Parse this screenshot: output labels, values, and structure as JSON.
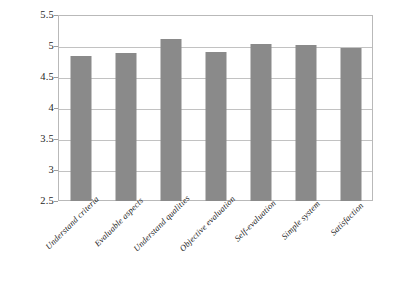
{
  "chart_data": {
    "type": "bar",
    "title": "",
    "subtitle": "",
    "xlabel": "",
    "ylabel": "",
    "ylim": [
      2.5,
      5.5
    ],
    "ytick_step": 0.5,
    "yticks": [
      "5.5",
      "5",
      "4.5",
      "4",
      "3.5",
      "3",
      "2.5"
    ],
    "ytick_values": [
      5.5,
      5.0,
      4.5,
      4.0,
      3.5,
      3.0,
      2.5
    ],
    "grid": true,
    "legend": "none",
    "bar_color": "#8a8a8a",
    "gridline_color": "#c2c2c2",
    "border_color": "#b9b9b9",
    "background_color": "#ffffff",
    "categories": [
      "Understand criteria",
      "Evaluable aspects",
      "Understand qualities",
      "Objective evaluation",
      "Self-evaluation",
      "Simple system",
      "Satisfaction"
    ],
    "values": [
      4.84,
      4.89,
      5.11,
      4.91,
      5.04,
      5.01,
      4.97
    ],
    "series": [
      {
        "name": "",
        "values": [
          4.84,
          4.89,
          5.11,
          4.91,
          5.04,
          5.01,
          4.97
        ]
      }
    ]
  }
}
